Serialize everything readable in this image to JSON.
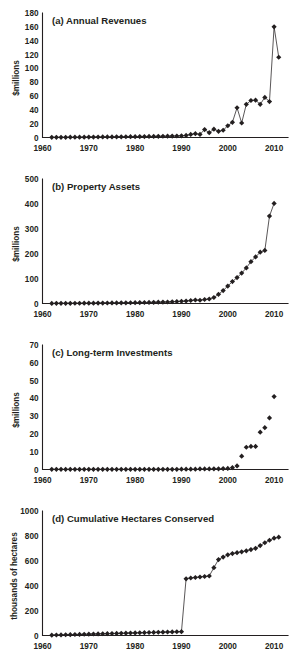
{
  "figure": {
    "background": "#ffffff",
    "ink_color": "#231f20",
    "panel_count": 4
  },
  "chart_data": [
    {
      "id": "panel-a",
      "type": "line",
      "title": "(a) Annual Revenues",
      "xlabel": "",
      "ylabel": "$millions",
      "xlim": [
        1960,
        2013
      ],
      "ylim": [
        0,
        180
      ],
      "xticks": [
        1960,
        1970,
        1980,
        1990,
        2000,
        2010
      ],
      "yticks": [
        0,
        20,
        40,
        60,
        80,
        100,
        120,
        140,
        160,
        180
      ],
      "grid": false,
      "legend": "none",
      "markers": true,
      "marker_shape": "diamond",
      "connected": true,
      "x": [
        1962,
        1963,
        1964,
        1965,
        1966,
        1967,
        1968,
        1969,
        1970,
        1971,
        1972,
        1973,
        1974,
        1975,
        1976,
        1977,
        1978,
        1979,
        1980,
        1981,
        1982,
        1983,
        1984,
        1985,
        1986,
        1987,
        1988,
        1989,
        1990,
        1991,
        1992,
        1993,
        1994,
        1995,
        1996,
        1997,
        1998,
        1999,
        2000,
        2001,
        2002,
        2003,
        2004,
        2005,
        2006,
        2007,
        2008,
        2009,
        2010,
        2011
      ],
      "values": [
        0.2,
        0.2,
        0.3,
        0.3,
        0.4,
        0.4,
        0.5,
        0.5,
        0.6,
        0.6,
        0.7,
        0.8,
        0.8,
        0.9,
        1.0,
        1.0,
        1.1,
        1.2,
        1.2,
        1.3,
        1.4,
        1.5,
        1.6,
        1.7,
        1.8,
        1.9,
        2.0,
        2.2,
        2.4,
        3.0,
        4.5,
        5.5,
        4.5,
        11.5,
        7.0,
        12.0,
        9.0,
        10.5,
        17.0,
        22.0,
        43.0,
        21.0,
        48.0,
        53.5,
        54.0,
        48.0,
        58.0,
        52.0,
        160.0,
        116.0,
        67.0,
        97.0
      ]
    },
    {
      "id": "panel-b",
      "type": "line",
      "title": "(b) Property Assets",
      "xlabel": "",
      "ylabel": "$millions",
      "xlim": [
        1960,
        2013
      ],
      "ylim": [
        0,
        500
      ],
      "xticks": [
        1960,
        1970,
        1980,
        1990,
        2000,
        2010
      ],
      "yticks": [
        0,
        100,
        200,
        300,
        400,
        500
      ],
      "grid": false,
      "legend": "none",
      "markers": true,
      "marker_shape": "diamond",
      "connected": true,
      "x": [
        1962,
        1963,
        1964,
        1965,
        1966,
        1967,
        1968,
        1969,
        1970,
        1971,
        1972,
        1973,
        1974,
        1975,
        1976,
        1977,
        1978,
        1979,
        1980,
        1981,
        1982,
        1983,
        1984,
        1985,
        1986,
        1987,
        1988,
        1989,
        1990,
        1991,
        1992,
        1993,
        1994,
        1995,
        1996,
        1997,
        1998,
        1999,
        2000,
        2001,
        2002,
        2003,
        2004,
        2005,
        2006,
        2007,
        2008,
        2009,
        2010
      ],
      "values": [
        0.5,
        0.6,
        0.7,
        0.8,
        0.9,
        1.0,
        1.1,
        1.2,
        1.3,
        1.5,
        1.6,
        1.8,
        2.0,
        2.2,
        2.4,
        2.6,
        2.8,
        3.0,
        3.3,
        3.6,
        4.0,
        4.4,
        4.8,
        5.2,
        5.6,
        6.0,
        7.0,
        8.0,
        9.0,
        10.0,
        12.0,
        14.0,
        13.0,
        16.0,
        18.0,
        24.0,
        37.0,
        52.0,
        70.0,
        88.0,
        104.0,
        122.0,
        143.0,
        168.0,
        187.0,
        206.0,
        213.0,
        351.0,
        402.0,
        423.0,
        470.0
      ]
    },
    {
      "id": "panel-c",
      "type": "scatter",
      "title": "(c) Long-term Investments",
      "xlabel": "",
      "ylabel": "$millions",
      "xlim": [
        1960,
        2013
      ],
      "ylim": [
        0,
        70
      ],
      "xticks": [
        1960,
        1970,
        1980,
        1990,
        2000,
        2010
      ],
      "yticks": [
        0,
        10,
        20,
        30,
        40,
        50,
        60,
        70
      ],
      "grid": false,
      "legend": "none",
      "markers": true,
      "marker_shape": "diamond",
      "connected": false,
      "x": [
        1962,
        1963,
        1964,
        1965,
        1966,
        1967,
        1968,
        1969,
        1970,
        1971,
        1972,
        1973,
        1974,
        1975,
        1976,
        1977,
        1978,
        1979,
        1980,
        1981,
        1982,
        1983,
        1984,
        1985,
        1986,
        1987,
        1988,
        1989,
        1990,
        1991,
        1992,
        1993,
        1994,
        1995,
        1996,
        1997,
        1998,
        1999,
        2000,
        2001,
        2002,
        2003,
        2004,
        2005,
        2006,
        2007,
        2008,
        2009,
        2010
      ],
      "values": [
        0.1,
        0.1,
        0.1,
        0.1,
        0.1,
        0.1,
        0.1,
        0.1,
        0.1,
        0.1,
        0.1,
        0.1,
        0.1,
        0.1,
        0.1,
        0.1,
        0.1,
        0.1,
        0.1,
        0.1,
        0.1,
        0.1,
        0.1,
        0.1,
        0.1,
        0.1,
        0.1,
        0.1,
        0.2,
        0.2,
        0.2,
        0.2,
        0.3,
        0.3,
        0.3,
        0.4,
        0.4,
        0.5,
        0.6,
        1.0,
        2.0,
        7.5,
        12.5,
        13.0,
        13.0,
        21.0,
        23.5,
        29.0,
        41.0,
        45.0,
        62.5
      ]
    },
    {
      "id": "panel-d",
      "type": "line",
      "title": "(d) Cumulative Hectares Conserved",
      "xlabel": "",
      "ylabel": "thousands of hectares",
      "xlim": [
        1960,
        2013
      ],
      "ylim": [
        0,
        1000
      ],
      "xticks": [
        1960,
        1970,
        1980,
        1990,
        2000,
        2010
      ],
      "yticks": [
        0,
        200,
        400,
        600,
        800,
        1000
      ],
      "grid": false,
      "legend": "none",
      "markers": true,
      "marker_shape": "diamond",
      "connected": true,
      "x": [
        1962,
        1963,
        1964,
        1965,
        1966,
        1967,
        1968,
        1969,
        1970,
        1971,
        1972,
        1973,
        1974,
        1975,
        1976,
        1977,
        1978,
        1979,
        1980,
        1981,
        1982,
        1983,
        1984,
        1985,
        1986,
        1987,
        1988,
        1989,
        1990,
        1991,
        1992,
        1993,
        1994,
        1995,
        1996,
        1997,
        1998,
        1999,
        2000,
        2001,
        2002,
        2003,
        2004,
        2005,
        2006,
        2007,
        2008,
        2009,
        2010,
        2011
      ],
      "values": [
        3,
        4,
        5,
        6,
        7,
        8,
        9,
        10,
        11,
        12,
        13,
        14,
        15,
        16,
        17,
        18,
        19,
        20,
        21,
        22,
        23,
        24,
        25,
        26,
        27,
        28,
        29,
        30,
        31,
        455,
        462,
        466,
        470,
        474,
        478,
        545,
        610,
        630,
        648,
        658,
        665,
        672,
        680,
        690,
        700,
        722,
        745,
        765,
        782,
        790,
        848,
        858,
        866,
        874,
        890
      ]
    }
  ]
}
